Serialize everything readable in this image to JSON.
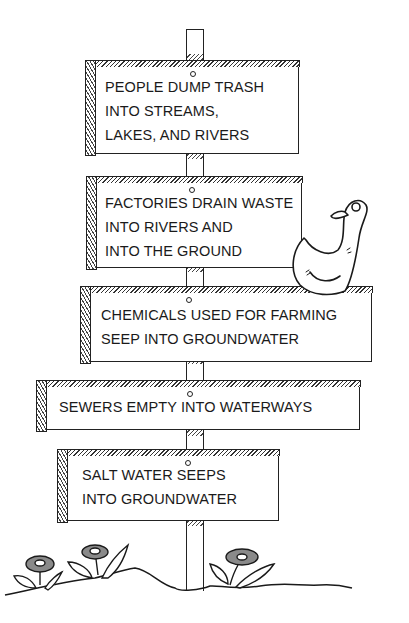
{
  "signs": [
    {
      "id": "trash",
      "lines": [
        "PEOPLE DUMP TRASH",
        "INTO STREAMS,",
        "LAKES, AND RIVERS"
      ]
    },
    {
      "id": "factories",
      "lines": [
        "FACTORIES DRAIN WASTE",
        "INTO RIVERS AND",
        "INTO THE GROUND"
      ]
    },
    {
      "id": "chemicals",
      "lines": [
        "CHEMICALS USED FOR FARMING",
        "SEEP INTO GROUNDWATER"
      ]
    },
    {
      "id": "sewers",
      "lines": [
        "SEWERS EMPTY INTO WATERWAYS"
      ]
    },
    {
      "id": "salt-water",
      "lines": [
        "SALT WATER SEEPS",
        "INTO GROUNDWATER"
      ]
    }
  ],
  "decorations": {
    "duck": "duck-icon",
    "flowers": [
      "flower-icon",
      "flower-icon",
      "flower-icon"
    ],
    "ground": "ground-line"
  },
  "colors": {
    "ink": "#1a1a1a",
    "flower_fill": "#8a8a8a",
    "background": "#ffffff"
  }
}
